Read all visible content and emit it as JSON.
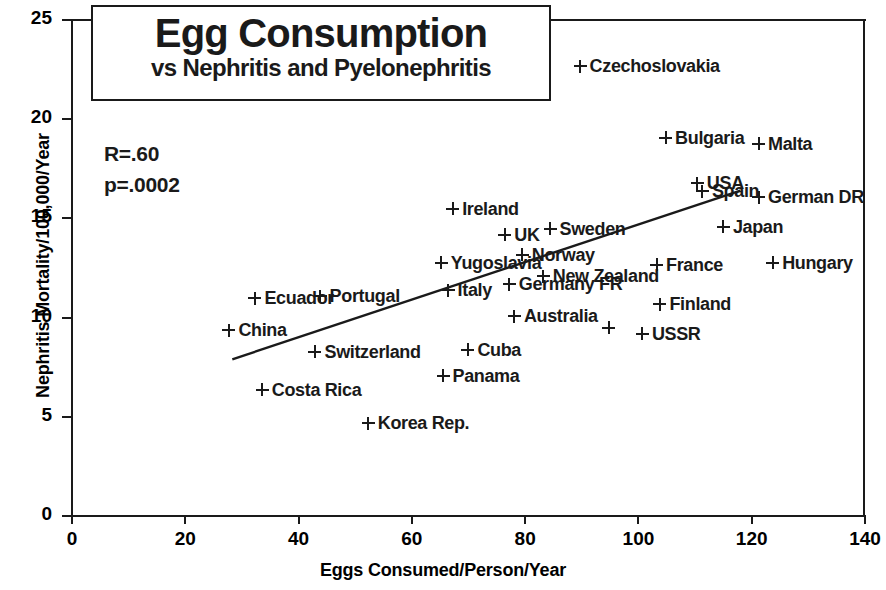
{
  "chart_data": {
    "type": "scatter",
    "title": "Egg Consumption",
    "subtitle": "vs Nephritis and Pyelonephritis",
    "xlabel": "Eggs Consumed/Person/Year",
    "ylabel": "Nephritis Mortality/100,000/Year",
    "xlim": [
      0,
      140
    ],
    "ylim": [
      0,
      25
    ],
    "xticks": [
      0,
      20,
      40,
      60,
      80,
      100,
      120,
      140
    ],
    "yticks": [
      0,
      5,
      10,
      15,
      20,
      25
    ],
    "grid": false,
    "legend": "none",
    "annotations": {
      "r_value": "R=.60",
      "p_value": "p=.0002"
    },
    "trendline": {
      "type": "linear",
      "x_start": 28.3,
      "y_start": 7.9,
      "x_end": 118.0,
      "y_end": 16.4
    },
    "points": [
      {
        "label": "Czechoslovakia",
        "x": 89.7,
        "y": 22.8
      },
      {
        "label": "Bulgaria",
        "x": 104.8,
        "y": 19.2
      },
      {
        "label": "Malta",
        "x": 121.2,
        "y": 18.9
      },
      {
        "label": "USA",
        "x": 110.4,
        "y": 16.9
      },
      {
        "label": "Spain",
        "x": 111.3,
        "y": 16.5
      },
      {
        "label": "German DR",
        "x": 121.2,
        "y": 16.2
      },
      {
        "label": "Ireland",
        "x": 67.2,
        "y": 15.6
      },
      {
        "label": "Sweden",
        "x": 84.4,
        "y": 14.6
      },
      {
        "label": "Japan",
        "x": 115.0,
        "y": 14.7
      },
      {
        "label": "UK",
        "x": 76.4,
        "y": 14.3
      },
      {
        "label": "Norway",
        "x": 79.5,
        "y": 13.3
      },
      {
        "label": "Yugoslavia",
        "x": 65.2,
        "y": 12.9
      },
      {
        "label": "France",
        "x": 103.2,
        "y": 12.8
      },
      {
        "label": "Hungary",
        "x": 123.7,
        "y": 12.9
      },
      {
        "label": "New Zealand",
        "x": 83.2,
        "y": 12.2
      },
      {
        "label": "Germany FR",
        "x": 77.2,
        "y": 11.8
      },
      {
        "label": "Italy",
        "x": 66.4,
        "y": 11.5
      },
      {
        "label": "Portugal",
        "x": 43.8,
        "y": 11.2
      },
      {
        "label": "Finland",
        "x": 103.8,
        "y": 10.8
      },
      {
        "label": "Ecuador",
        "x": 32.3,
        "y": 11.1
      },
      {
        "label": "Australia",
        "x": 78.1,
        "y": 10.2
      },
      {
        "label": "China",
        "x": 27.7,
        "y": 9.5
      },
      {
        "label": "",
        "x": 94.8,
        "y": 9.5
      },
      {
        "label": "USSR",
        "x": 100.7,
        "y": 9.3
      },
      {
        "label": "Switzerland",
        "x": 42.9,
        "y": 8.4
      },
      {
        "label": "Cuba",
        "x": 69.9,
        "y": 8.5
      },
      {
        "label": "Panama",
        "x": 65.5,
        "y": 7.2
      },
      {
        "label": "Costa Rica",
        "x": 33.6,
        "y": 6.5
      },
      {
        "label": "Korea Rep.",
        "x": 52.3,
        "y": 4.8
      }
    ]
  }
}
